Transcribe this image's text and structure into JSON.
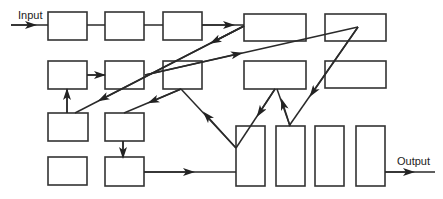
{
  "diagram": {
    "type": "block-flow-diagram",
    "labels": {
      "input": "Input",
      "output": "Output"
    },
    "colors": {
      "stroke": "#333333",
      "background": "#ffffff"
    },
    "boxes": [
      {
        "id": "b1",
        "row": 1,
        "col": 1
      },
      {
        "id": "b2",
        "row": 1,
        "col": 2
      },
      {
        "id": "b3",
        "row": 1,
        "col": 3
      },
      {
        "id": "b4",
        "row": 1,
        "col": 4
      },
      {
        "id": "b5",
        "row": 1,
        "col": 5
      },
      {
        "id": "b6",
        "row": 2,
        "col": 1
      },
      {
        "id": "b7",
        "row": 2,
        "col": 2
      },
      {
        "id": "b8",
        "row": 2,
        "col": 3
      },
      {
        "id": "b9",
        "row": 2,
        "col": 4
      },
      {
        "id": "b10",
        "row": 2,
        "col": 5
      },
      {
        "id": "b11",
        "row": 3,
        "col": 1
      },
      {
        "id": "b12",
        "row": 3,
        "col": 2
      },
      {
        "id": "b13",
        "row": 4,
        "col": 1
      },
      {
        "id": "b14",
        "row": 4,
        "col": 2
      },
      {
        "id": "t1",
        "row": "tall",
        "col": 1
      },
      {
        "id": "t2",
        "row": "tall",
        "col": 2
      },
      {
        "id": "t3",
        "row": "tall",
        "col": 3
      },
      {
        "id": "t4",
        "row": "tall",
        "col": 4
      }
    ],
    "connections": [
      {
        "from": "input",
        "to": "b1",
        "arrow": true
      },
      {
        "from": "b1",
        "to": "b2",
        "arrow": false
      },
      {
        "from": "b2",
        "to": "b3",
        "arrow": false
      },
      {
        "from": "b3",
        "to": "b4",
        "arrow": true
      },
      {
        "from": "b4",
        "to": "b11",
        "arrow": true
      },
      {
        "from": "b7",
        "to": "b5",
        "arrow": true
      },
      {
        "from": "b5",
        "to": "t2",
        "arrow": true
      },
      {
        "from": "b6",
        "to": "b7",
        "arrow": true
      },
      {
        "from": "b11",
        "to": "b6",
        "arrow": true
      },
      {
        "from": "b8",
        "to": "b12",
        "arrow": true
      },
      {
        "from": "t1",
        "to": "b8",
        "arrow": true
      },
      {
        "from": "b9",
        "to": "t1",
        "arrow": true
      },
      {
        "from": "t2",
        "to": "b9",
        "arrow": true
      },
      {
        "from": "b12",
        "to": "b14",
        "arrow": true
      },
      {
        "from": "b14",
        "to": "t1",
        "arrow": true
      },
      {
        "from": "t4",
        "to": "output",
        "arrow": true
      }
    ]
  }
}
